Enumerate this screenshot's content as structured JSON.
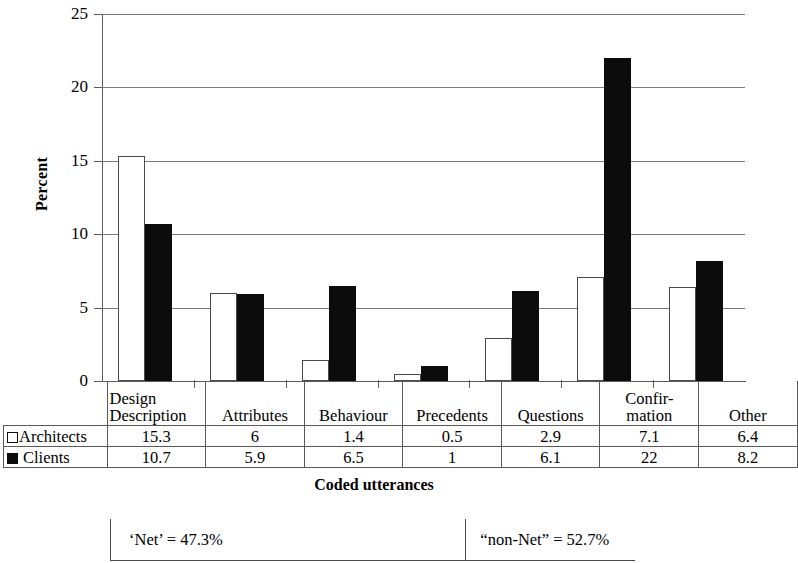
{
  "chart_data": {
    "type": "bar",
    "title": "",
    "xlabel": "Coded utterances",
    "ylabel": "Percent",
    "ylim": [
      0,
      25
    ],
    "ytick_labels": [
      "0",
      "5",
      "10",
      "15",
      "20",
      "25"
    ],
    "ytick_values": [
      0,
      5,
      10,
      15,
      20,
      25
    ],
    "grid": true,
    "legend_position": "table-row-labels",
    "categories": [
      "Design Description",
      "Attributes",
      "Behaviour",
      "Precedents",
      "Questions",
      "Confirmation",
      "Other"
    ],
    "category_lines": [
      [
        "Design",
        "Description"
      ],
      [
        "",
        "Attributes"
      ],
      [
        "",
        "Behaviour"
      ],
      [
        "",
        "Precedents"
      ],
      [
        "",
        "Questions"
      ],
      [
        "Confir-",
        "mation"
      ],
      [
        "",
        "Other"
      ]
    ],
    "series": [
      {
        "name": "Architects",
        "marker": "open-square",
        "color": "#ffffff",
        "edge_color": "#4a4a4a",
        "values": [
          15.3,
          6,
          1.4,
          0.5,
          2.9,
          7.1,
          6.4
        ],
        "value_labels": [
          "15.3",
          "6",
          "1.4",
          "0.5",
          "2.9",
          "7.1",
          "6.4"
        ]
      },
      {
        "name": "Clients",
        "marker": "filled-square",
        "color": "#0c0c0c",
        "edge_color": "#0c0c0c",
        "values": [
          10.7,
          5.9,
          6.5,
          1,
          6.1,
          22,
          8.2
        ],
        "value_labels": [
          "10.7",
          "5.9",
          "6.5",
          "1",
          "6.1",
          "22",
          "8.2"
        ]
      }
    ]
  },
  "table": {
    "corner_label": "",
    "row_labels": [
      "Architects",
      "Clients"
    ]
  },
  "footer": {
    "net_label": "‘Net’ = 47.3%",
    "non_net_label": "“non-Net” = 52.7%"
  }
}
